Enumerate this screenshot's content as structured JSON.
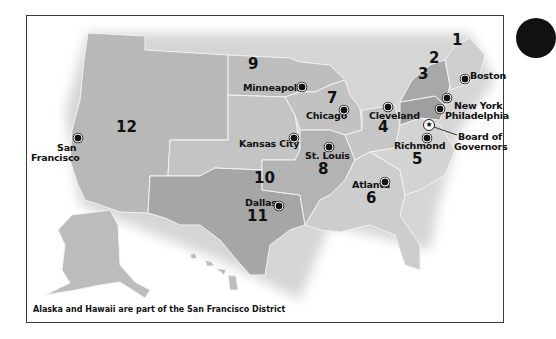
{
  "map": {
    "title_implied": "Federal Reserve Districts",
    "footnote": "Alaska and Hawaii are part of the San Francisco District",
    "colors": {
      "district_light": "#c9c9c9",
      "district_mid": "#b5b5b5",
      "district_dark": "#a3a3a3",
      "border": "#f2f2f2",
      "frame": "#3a3a3a"
    },
    "districts": [
      {
        "number": "1",
        "city": "Boston"
      },
      {
        "number": "2",
        "city": "New York"
      },
      {
        "number": "3",
        "city": "Philadelphia"
      },
      {
        "number": "4",
        "city": "Cleveland"
      },
      {
        "number": "5",
        "city": "Richmond"
      },
      {
        "number": "6",
        "city": "Atlanta"
      },
      {
        "number": "7",
        "city": "Chicago"
      },
      {
        "number": "8",
        "city": "St. Louis"
      },
      {
        "number": "9",
        "city": "Minneapolis"
      },
      {
        "number": "10",
        "city": "Kansas City"
      },
      {
        "number": "11",
        "city": "Dallas"
      },
      {
        "number": "12",
        "city": "San Francisco"
      }
    ],
    "san_francisco_label": [
      "San",
      "Francisco"
    ],
    "board": {
      "line1": "Board of",
      "line2": "Governors",
      "icon": "star-icon"
    }
  }
}
